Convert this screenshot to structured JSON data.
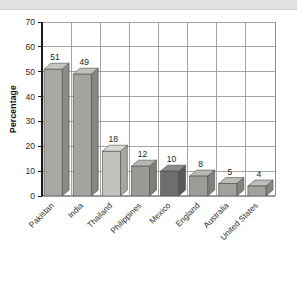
{
  "chart_data": {
    "type": "bar",
    "title": "",
    "subtitle": "",
    "xlabel": "",
    "ylabel": "Percentage",
    "ylim": [
      0,
      70
    ],
    "ytick_step": 10,
    "yticks": [
      0,
      10,
      20,
      30,
      40,
      50,
      60,
      70
    ],
    "grid": "both",
    "legend": "none",
    "style": "3d-bars",
    "categories": [
      "Pakistan",
      "India",
      "Thailand",
      "Philippines",
      "Mexico",
      "England",
      "Australia",
      "United States"
    ],
    "values": [
      51,
      49,
      18,
      12,
      10,
      8,
      5,
      4
    ],
    "value_labels": [
      "51",
      "49",
      "18",
      "12",
      "10",
      "8",
      "5",
      "4"
    ],
    "bar_colors": [
      "#a8a8a4",
      "#a4a4a0",
      "#c2c2be",
      "#9a9a96",
      "#6e6e6c",
      "#9c9c98",
      "#a0a09c",
      "#a2a29e"
    ],
    "bar_top_colors": [
      "#c4c4c0",
      "#c0c0bc",
      "#d8d8d4",
      "#b6b6b2",
      "#8c8c8a",
      "#b8b8b4",
      "#bcbcb8",
      "#bebeba"
    ],
    "bar_side_colors": [
      "#8a8a86",
      "#868682",
      "#a6a6a2",
      "#7e7e7a",
      "#585856",
      "#80807c",
      "#84847f",
      "#868681"
    ]
  },
  "axis": {
    "ytick_labels": [
      "70",
      "60",
      "50",
      "40",
      "30",
      "20",
      "10",
      "0"
    ],
    "y_axis_title": "Percentage"
  },
  "colors": {
    "background": "#ffffff",
    "header_strip": "#e2e2e2",
    "grid": "#9a9a9a",
    "axis_line": "#1a1a1a",
    "plot_border": "#8c8c8c",
    "text": "#2b2b2b"
  }
}
